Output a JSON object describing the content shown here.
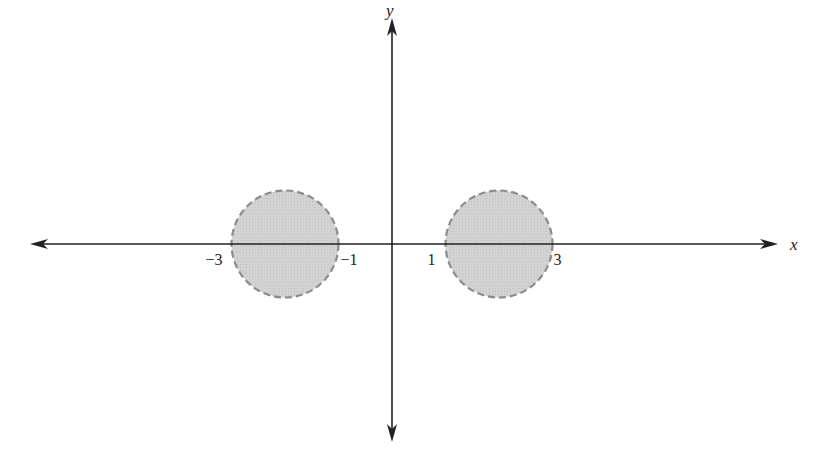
{
  "figure": {
    "width": 823,
    "height": 466,
    "background": "#ffffff",
    "axis_color": "#222222",
    "region_fill": "#cfcfcf",
    "region_stroke": "#8c8c8c"
  },
  "axes": {
    "origin_px": [
      392,
      244
    ],
    "unit_px": 53.5,
    "x_label": "x",
    "y_label": "y",
    "x_extent_px": [
      30,
      778
    ],
    "y_extent_px": [
      18,
      442
    ]
  },
  "ticks": [
    {
      "value": -3,
      "text": "−3"
    },
    {
      "value": -1,
      "text": "−1"
    },
    {
      "value": 1,
      "text": "1"
    },
    {
      "value": 3,
      "text": "3"
    }
  ],
  "regions": [
    {
      "name": "left-disk",
      "center": [
        -2,
        0
      ],
      "radius": 1,
      "boundary": "dashed",
      "filled": true
    },
    {
      "name": "right-disk",
      "center": [
        2,
        0
      ],
      "radius": 1,
      "boundary": "dashed",
      "filled": true
    }
  ]
}
